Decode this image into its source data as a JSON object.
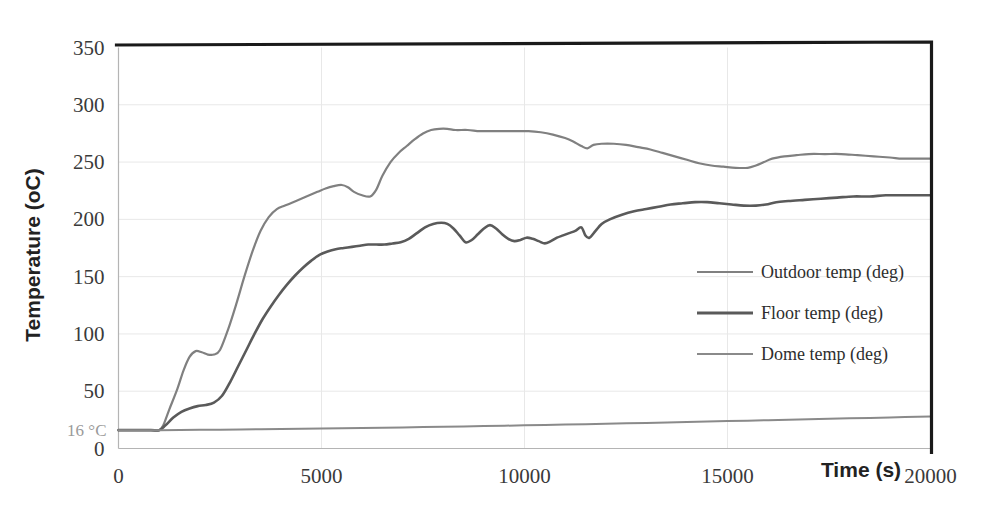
{
  "chart_data": {
    "type": "line",
    "title": "",
    "xlabel": "Time (s)",
    "ylabel": "Temperature  (oC)",
    "xlim": [
      0,
      20000
    ],
    "ylim": [
      0,
      350
    ],
    "xticks": [
      "0",
      "5000",
      "10000",
      "15000",
      "20000"
    ],
    "xtick_values": [
      0,
      5000,
      10000,
      15000,
      20000
    ],
    "yticks": [
      "0",
      "50",
      "100",
      "150",
      "200",
      "250",
      "300",
      "350"
    ],
    "ytick_values": [
      0,
      50,
      100,
      150,
      200,
      250,
      300,
      350
    ],
    "grid": true,
    "legend_position": "center-right",
    "annotations": [
      {
        "text": "16 °C",
        "x": 0,
        "y": 16,
        "color": "#9a9a9a"
      }
    ],
    "series": [
      {
        "name": "Outdoor temp (deg)",
        "color": "#808080",
        "width": 2.2,
        "x": [
          0,
          400,
          800,
          1000,
          1100,
          1250,
          1450,
          1600,
          1750,
          1900,
          2050,
          2200,
          2350,
          2500,
          2700,
          2900,
          3100,
          3300,
          3500,
          3700,
          3900,
          4100,
          4300,
          4500,
          4700,
          4900,
          5100,
          5300,
          5500,
          5650,
          5800,
          6000,
          6200,
          6350,
          6500,
          6700,
          6900,
          7100,
          7300,
          7500,
          7700,
          7900,
          8100,
          8300,
          8600,
          8900,
          9200,
          9500,
          9800,
          10100,
          10400,
          10700,
          11000,
          11200,
          11400,
          11550,
          11700,
          11900,
          12200,
          12500,
          12800,
          13100,
          13400,
          13700,
          14000,
          14300,
          14600,
          14900,
          15200,
          15500,
          15700,
          15900,
          16100,
          16400,
          16700,
          17000,
          17400,
          17800,
          18200,
          18600,
          19000,
          19300,
          19600,
          19800,
          20000
        ],
        "y": [
          16,
          16,
          16,
          16,
          20,
          34,
          52,
          68,
          80,
          85,
          84,
          82,
          82,
          86,
          104,
          126,
          150,
          172,
          190,
          202,
          209,
          212,
          215,
          218,
          221,
          224,
          227,
          229,
          230,
          228,
          224,
          221,
          220,
          226,
          238,
          250,
          258,
          264,
          270,
          275,
          278,
          279,
          279,
          278,
          278,
          277,
          277,
          277,
          277,
          277,
          276,
          274,
          271,
          268,
          264,
          262,
          265,
          266,
          266,
          265,
          263,
          261,
          258,
          255,
          252,
          249,
          247,
          246,
          245,
          245,
          247,
          250,
          253,
          255,
          256,
          257,
          257,
          257,
          256,
          255,
          254,
          253,
          253,
          253,
          253
        ]
      },
      {
        "name": "Floor temp (deg)",
        "color": "#5a5a5a",
        "width": 2.6,
        "x": [
          0,
          400,
          800,
          1000,
          1150,
          1350,
          1550,
          1750,
          1950,
          2150,
          2350,
          2550,
          2750,
          2950,
          3150,
          3350,
          3550,
          3750,
          3950,
          4150,
          4350,
          4550,
          4750,
          4950,
          5150,
          5350,
          5550,
          5750,
          5950,
          6150,
          6350,
          6550,
          6750,
          6950,
          7150,
          7350,
          7550,
          7750,
          7950,
          8100,
          8250,
          8400,
          8550,
          8700,
          8850,
          9000,
          9150,
          9300,
          9450,
          9600,
          9750,
          9900,
          10050,
          10200,
          10350,
          10500,
          10650,
          10800,
          10950,
          11100,
          11250,
          11400,
          11500,
          11600,
          11750,
          11900,
          12100,
          12400,
          12700,
          13000,
          13300,
          13600,
          13900,
          14200,
          14500,
          14800,
          15100,
          15400,
          15700,
          15950,
          16200,
          16500,
          16900,
          17300,
          17700,
          18100,
          18500,
          18900,
          19300,
          19600,
          19850,
          20000
        ],
        "y": [
          16,
          16,
          16,
          16,
          20,
          27,
          32,
          35,
          37,
          38,
          40,
          46,
          58,
          72,
          86,
          100,
          113,
          124,
          134,
          143,
          151,
          158,
          164,
          169,
          172,
          174,
          175,
          176,
          177,
          178,
          178,
          178,
          179,
          180,
          183,
          188,
          193,
          196,
          197,
          196,
          192,
          186,
          180,
          182,
          187,
          192,
          195,
          192,
          187,
          183,
          181,
          182,
          184,
          183,
          181,
          179,
          181,
          184,
          186,
          188,
          190,
          193,
          186,
          184,
          190,
          196,
          200,
          204,
          207,
          209,
          211,
          213,
          214,
          215,
          215,
          214,
          213,
          212,
          212,
          213,
          215,
          216,
          217,
          218,
          219,
          220,
          220,
          221,
          221,
          221,
          221,
          221
        ]
      },
      {
        "name": "Dome temp (deg)",
        "color": "#8a8a8a",
        "width": 2.0,
        "x": [
          0,
          1000,
          2000,
          3000,
          4000,
          5000,
          6000,
          7000,
          8000,
          9000,
          10000,
          11000,
          12000,
          13000,
          14000,
          15000,
          16000,
          17000,
          18000,
          19000,
          20000
        ],
        "y": [
          16,
          16,
          16.3,
          16.6,
          17,
          17.4,
          17.9,
          18.4,
          19,
          19.6,
          20.2,
          20.9,
          21.6,
          22.3,
          23.1,
          23.9,
          24.7,
          25.5,
          26.3,
          27.1,
          28
        ]
      }
    ],
    "legend_entries": [
      {
        "label": "Outdoor temp (deg)",
        "color": "#808080"
      },
      {
        "label": "Floor temp (deg)",
        "color": "#5a5a5a"
      },
      {
        "label": "Dome temp (deg)",
        "color": "#8a8a8a"
      }
    ]
  }
}
